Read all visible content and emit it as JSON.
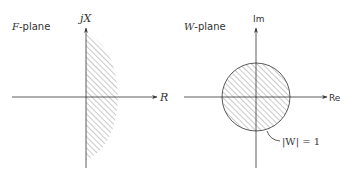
{
  "left_panel": {
    "plane_label_var": "F",
    "plane_label_suffix": "-plane",
    "vertical_axis_label": "jX",
    "horizontal_axis_label": "R",
    "region": "right half-plane (hatched)"
  },
  "right_panel": {
    "plane_label_var": "W",
    "plane_label_suffix": "-plane",
    "vertical_axis_label": "Im",
    "horizontal_axis_label": "Re",
    "circle_annotation": "|W| = 1",
    "region": "unit disk interior (hatched)"
  },
  "colors": {
    "ink": "#333333",
    "hatch": "#8a8a8a"
  }
}
